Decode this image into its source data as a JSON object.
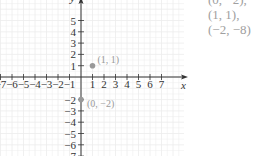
{
  "chart_data": {
    "type": "scatter",
    "title": "",
    "xlabel": "x",
    "ylabel": "y",
    "xlim": [
      -7,
      7
    ],
    "ylim": [
      -7,
      6
    ],
    "grid": true,
    "x_ticks": [
      -7,
      -6,
      -5,
      -4,
      -3,
      -2,
      -1,
      1,
      2,
      3,
      4,
      5,
      6,
      7
    ],
    "x_tick_labels": [
      "−7",
      "−6",
      "−5",
      "−4",
      "−3",
      "−2",
      "−1",
      "1",
      "2",
      "3",
      "4",
      "5",
      "6",
      "7"
    ],
    "y_ticks": [
      5,
      4,
      3,
      2,
      1,
      -2,
      -3,
      -4,
      -5,
      -6,
      -7
    ],
    "y_tick_labels": [
      "5",
      "4",
      "3",
      "2",
      "1",
      "−2",
      "−3",
      "−4",
      "−5",
      "−6",
      "−7"
    ],
    "points": [
      {
        "x": 1,
        "y": 1,
        "label": "(1, 1)"
      },
      {
        "x": 0,
        "y": -2,
        "label": "(0, −2)"
      }
    ],
    "colors": {
      "axis": "#333333",
      "grid": "#ececec",
      "point": "#999999",
      "point_label": "#9a9a9a"
    }
  },
  "side_text": {
    "lines": [
      "(0, −2),",
      "(1, 1),",
      "(−2, −8)"
    ]
  }
}
